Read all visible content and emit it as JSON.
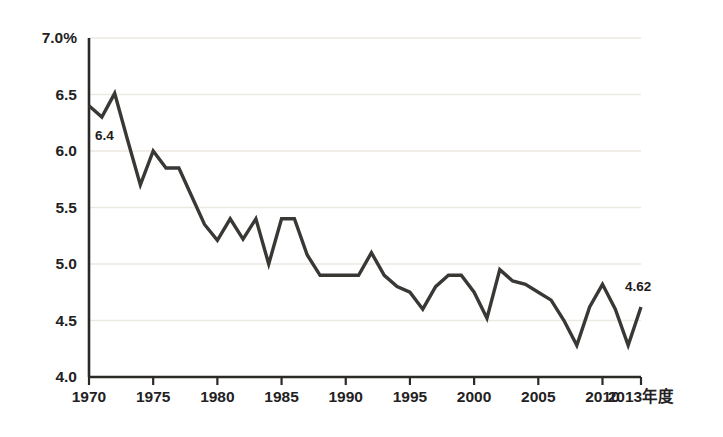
{
  "chart_data": {
    "type": "line",
    "title": "",
    "subtitle": "",
    "xlabel": "",
    "ylabel": "",
    "unit": "%",
    "grid": true,
    "legend": false,
    "legend_position": "none",
    "xlim": [
      1970,
      2013
    ],
    "ylim": [
      4.0,
      7.0
    ],
    "yticks": [
      "4.0",
      "4.5",
      "5.0",
      "5.5",
      "6.0",
      "6.5",
      "7.0%"
    ],
    "ytick_values": [
      4.0,
      4.5,
      5.0,
      5.5,
      6.0,
      6.5,
      7.0
    ],
    "xticks": [
      "1970",
      "1975",
      "1980",
      "1985",
      "1990",
      "1995",
      "2000",
      "2005",
      "2010",
      "2013年度"
    ],
    "xtick_values": [
      1970,
      1975,
      1980,
      1985,
      1990,
      1995,
      2000,
      2005,
      2010,
      2013
    ],
    "x": [
      1970,
      1971,
      1972,
      1973,
      1974,
      1975,
      1976,
      1977,
      1978,
      1979,
      1980,
      1981,
      1982,
      1983,
      1984,
      1985,
      1986,
      1987,
      1988,
      1989,
      1990,
      1991,
      1992,
      1993,
      1994,
      1995,
      1996,
      1997,
      1998,
      1999,
      2000,
      2001,
      2002,
      2003,
      2004,
      2005,
      2006,
      2007,
      2008,
      2009,
      2010,
      2011,
      2012,
      2013
    ],
    "series": [
      {
        "name": "",
        "color": "#3a3835",
        "values": [
          6.4,
          6.3,
          6.51,
          6.1,
          5.7,
          6.0,
          5.85,
          5.85,
          5.6,
          5.35,
          5.21,
          5.4,
          5.22,
          5.4,
          5.0,
          5.4,
          5.4,
          5.08,
          4.9,
          4.9,
          4.9,
          4.9,
          5.1,
          4.9,
          4.8,
          4.75,
          4.6,
          4.8,
          4.9,
          4.9,
          4.75,
          4.52,
          4.95,
          4.85,
          4.82,
          4.75,
          4.68,
          4.5,
          4.28,
          4.62,
          4.82,
          4.6,
          4.28,
          4.62
        ]
      }
    ],
    "annotations": [
      {
        "label": "6.4",
        "x": 1970,
        "y": 6.4,
        "dx": 6,
        "dy": 34
      },
      {
        "label": "4.62",
        "x": 2013,
        "y": 4.62,
        "dx": -16,
        "dy": -16
      }
    ]
  },
  "axis": {
    "y_axis_name": "y-axis",
    "x_axis_name": "x-axis"
  }
}
